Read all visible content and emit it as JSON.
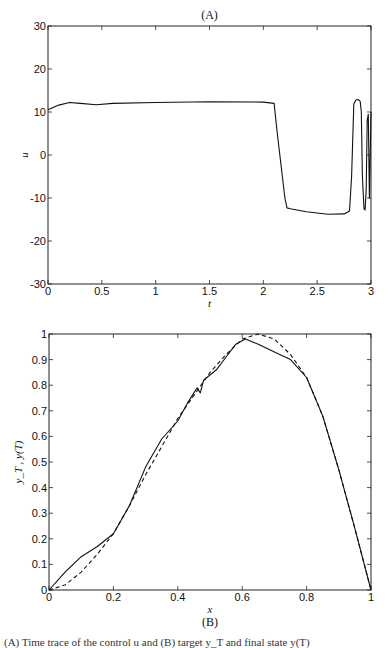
{
  "figure": {
    "panel_a_label": "(A)",
    "panel_b_label": "(B)",
    "caption_visible": "(A) Time trace of the control u and (B) target y_T and final state y(T)"
  },
  "chart_data": [
    {
      "type": "line",
      "title": "(A)",
      "xlabel": "t",
      "ylabel": "u",
      "xlim": [
        0,
        3
      ],
      "ylim": [
        -30,
        30
      ],
      "xticks": [
        0,
        0.5,
        1,
        1.5,
        2,
        2.5,
        3
      ],
      "xtick_labels": [
        "0",
        "0.5",
        "1",
        "1.5",
        "2",
        "2.5",
        "3"
      ],
      "yticks": [
        -30,
        -20,
        -10,
        0,
        10,
        20,
        30
      ],
      "ytick_labels": [
        "-30",
        "-20",
        "-10",
        "0",
        "10",
        "20",
        "30"
      ],
      "grid": false,
      "series": [
        {
          "name": "u",
          "style": "solid",
          "x": [
            0,
            0.1,
            0.2,
            0.3,
            0.45,
            0.6,
            1.0,
            1.5,
            2.0,
            2.1,
            2.13,
            2.2,
            2.22,
            2.25,
            2.4,
            2.6,
            2.75,
            2.8,
            2.82,
            2.84,
            2.86,
            2.88,
            2.9,
            2.91,
            2.92,
            2.935,
            2.945,
            2.955,
            2.965,
            2.975,
            2.985,
            3.0
          ],
          "y": [
            10.5,
            11.6,
            12.2,
            12.0,
            11.7,
            12.0,
            12.2,
            12.4,
            12.3,
            12.0,
            5,
            -10,
            -12.3,
            -12.5,
            -13.2,
            -13.8,
            -13.7,
            -13.0,
            -5,
            11.8,
            12.8,
            12.9,
            12.5,
            10,
            -5,
            -12.5,
            -12.8,
            -8,
            8,
            9.5,
            -10,
            10
          ]
        }
      ]
    },
    {
      "type": "line",
      "title": "(B)",
      "xlabel": "x",
      "ylabel": "y_T , y(T)",
      "xlim": [
        0,
        1
      ],
      "ylim": [
        0,
        1
      ],
      "xticks": [
        0,
        0.2,
        0.4,
        0.6,
        0.8,
        1
      ],
      "xtick_labels": [
        "0",
        "0.2",
        "0.4",
        "0.6",
        "0.8",
        "1"
      ],
      "yticks": [
        0,
        0.1,
        0.2,
        0.3,
        0.4,
        0.5,
        0.6,
        0.7,
        0.8,
        0.9,
        1
      ],
      "ytick_labels": [
        "0",
        "0.1",
        "0.2",
        "0.3",
        "0.4",
        "0.5",
        "0.6",
        "0.7",
        "0.8",
        "0.9",
        "1"
      ],
      "grid": false,
      "series": [
        {
          "name": "y(T)",
          "style": "solid",
          "x": [
            0,
            0.05,
            0.1,
            0.15,
            0.2,
            0.25,
            0.3,
            0.35,
            0.4,
            0.43,
            0.45,
            0.46,
            0.47,
            0.48,
            0.5,
            0.52,
            0.55,
            0.58,
            0.61,
            0.65,
            0.7,
            0.75,
            0.8,
            0.85,
            0.9,
            0.95,
            1.0
          ],
          "y": [
            0,
            0.07,
            0.13,
            0.17,
            0.22,
            0.33,
            0.48,
            0.59,
            0.66,
            0.73,
            0.77,
            0.79,
            0.77,
            0.82,
            0.84,
            0.86,
            0.91,
            0.96,
            0.98,
            0.96,
            0.93,
            0.9,
            0.83,
            0.68,
            0.47,
            0.24,
            0.0
          ]
        },
        {
          "name": "y_T",
          "style": "dashed",
          "x": [
            0,
            0.05,
            0.1,
            0.15,
            0.2,
            0.25,
            0.3,
            0.35,
            0.4,
            0.45,
            0.5,
            0.55,
            0.6,
            0.65,
            0.7,
            0.75,
            0.8,
            0.85,
            0.9,
            0.95,
            1.0
          ],
          "y": [
            0,
            0.02,
            0.07,
            0.14,
            0.22,
            0.33,
            0.45,
            0.56,
            0.67,
            0.76,
            0.85,
            0.92,
            0.98,
            1.0,
            0.98,
            0.92,
            0.83,
            0.68,
            0.47,
            0.24,
            0.0
          ]
        }
      ]
    }
  ]
}
